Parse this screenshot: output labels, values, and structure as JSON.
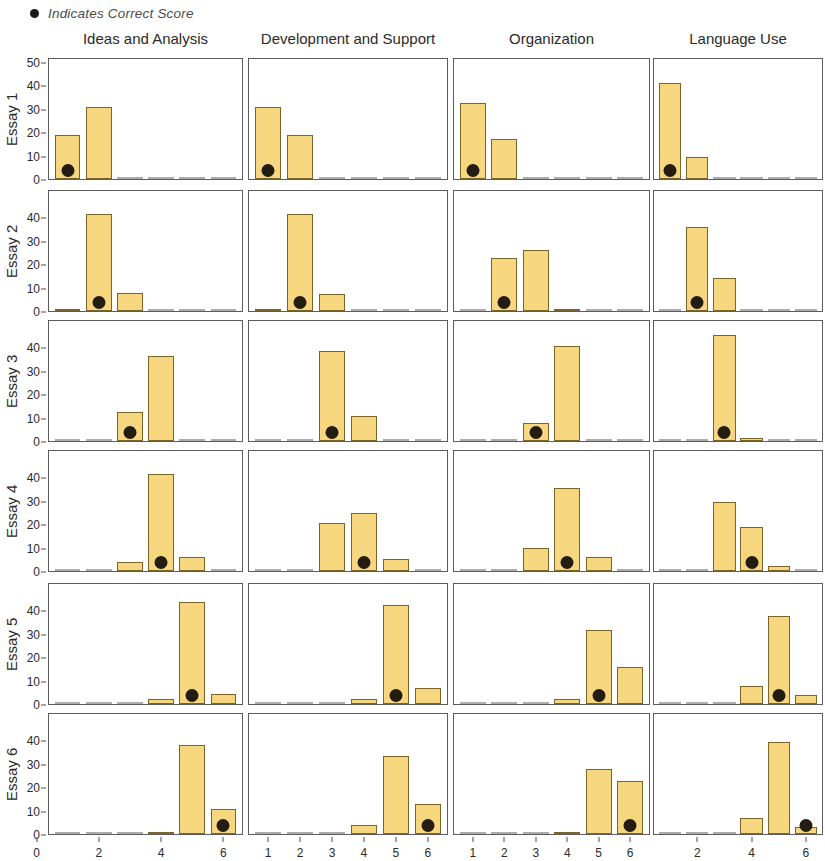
{
  "legend": {
    "marker": "filled-circle",
    "label": "Indicates Correct Score",
    "color": "#1b1b1b"
  },
  "style": {
    "bar_fill": "#f7d680",
    "bar_stroke": "#7a6427",
    "dot_color": "#231c10",
    "panel_border": "#5c5c5c"
  },
  "columns": [
    {
      "label": "Ideas and Analysis",
      "xticks": [
        0,
        2,
        4,
        6
      ]
    },
    {
      "label": "Development and Support",
      "xticks": [
        1,
        2,
        3,
        4,
        5,
        6
      ]
    },
    {
      "label": "Organization",
      "xticks": [
        1,
        2,
        3,
        4,
        5,
        6
      ]
    },
    {
      "label": "Language Use",
      "xticks": [
        2,
        4,
        6
      ]
    }
  ],
  "rows": [
    {
      "label": "Essay 1"
    },
    {
      "label": "Essay 2"
    },
    {
      "label": "Essay 3"
    },
    {
      "label": "Essay 4"
    },
    {
      "label": "Essay 5"
    },
    {
      "label": "Essay 6"
    }
  ],
  "yticks": [
    0,
    10,
    20,
    30,
    40,
    50
  ],
  "chart_data": {
    "type": "bar",
    "title": "",
    "subtitle": "",
    "xlabel": "Score",
    "ylabel": "Percent of Raters",
    "xlim": [
      0.4,
      6.6
    ],
    "ylim": [
      0,
      52
    ],
    "grid": false,
    "legend_position": "top-left",
    "legend_entries": [
      "Indicates Correct Score"
    ],
    "annotation": "Black dot marks the correct (official) score for each essay / domain.",
    "facet_rows": [
      "Essay 1",
      "Essay 2",
      "Essay 3",
      "Essay 4",
      "Essay 5",
      "Essay 6"
    ],
    "facet_cols": [
      "Ideas and Analysis",
      "Development and Support",
      "Organization",
      "Language Use"
    ],
    "categories": [
      1,
      2,
      3,
      4,
      5,
      6
    ],
    "panels": [
      {
        "row": "Essay 1",
        "col": "Ideas and Analysis",
        "values": [
          19,
          31,
          0,
          0,
          0,
          0
        ],
        "correct_score": 1
      },
      {
        "row": "Essay 1",
        "col": "Development and Support",
        "values": [
          31,
          19,
          0,
          0,
          0,
          0
        ],
        "correct_score": 1
      },
      {
        "row": "Essay 1",
        "col": "Organization",
        "values": [
          33,
          17.5,
          0,
          0,
          0,
          0
        ],
        "correct_score": 1
      },
      {
        "row": "Essay 1",
        "col": "Language Use",
        "values": [
          41.5,
          9.5,
          0,
          0,
          0,
          0
        ],
        "correct_score": 1
      },
      {
        "row": "Essay 2",
        "col": "Ideas and Analysis",
        "values": [
          0.5,
          42,
          8,
          0,
          0,
          0
        ],
        "correct_score": 2
      },
      {
        "row": "Essay 2",
        "col": "Development and Support",
        "values": [
          0.7,
          42,
          7.5,
          0,
          0,
          0
        ],
        "correct_score": 2
      },
      {
        "row": "Essay 2",
        "col": "Organization",
        "values": [
          0,
          23,
          26.5,
          0.6,
          0,
          0
        ],
        "correct_score": 2
      },
      {
        "row": "Essay 2",
        "col": "Language Use",
        "values": [
          0,
          36.5,
          14.5,
          0,
          0,
          0
        ],
        "correct_score": 2
      },
      {
        "row": "Essay 3",
        "col": "Ideas and Analysis",
        "values": [
          0,
          0,
          12.5,
          37,
          0,
          0
        ],
        "correct_score": 3
      },
      {
        "row": "Essay 3",
        "col": "Development and Support",
        "values": [
          0,
          0,
          39,
          11,
          0,
          0
        ],
        "correct_score": 3
      },
      {
        "row": "Essay 3",
        "col": "Organization",
        "values": [
          0,
          0,
          8,
          41,
          0,
          0
        ],
        "correct_score": 3
      },
      {
        "row": "Essay 3",
        "col": "Language Use",
        "values": [
          0,
          0,
          46,
          1.2,
          0,
          0
        ],
        "correct_score": 3
      },
      {
        "row": "Essay 4",
        "col": "Ideas and Analysis",
        "values": [
          0,
          0,
          4,
          42,
          6,
          0
        ],
        "correct_score": 4
      },
      {
        "row": "Essay 4",
        "col": "Development and Support",
        "values": [
          0,
          0,
          21,
          25,
          5,
          0
        ],
        "correct_score": 4
      },
      {
        "row": "Essay 4",
        "col": "Organization",
        "values": [
          0,
          0,
          10,
          36,
          6,
          0
        ],
        "correct_score": 4
      },
      {
        "row": "Essay 4",
        "col": "Language Use",
        "values": [
          0,
          0,
          30,
          19,
          2,
          0
        ],
        "correct_score": 4
      },
      {
        "row": "Essay 5",
        "col": "Ideas and Analysis",
        "values": [
          0,
          0,
          0,
          2,
          44,
          4.5
        ],
        "correct_score": 5
      },
      {
        "row": "Essay 5",
        "col": "Development and Support",
        "values": [
          0,
          0,
          0,
          2,
          43,
          7
        ],
        "correct_score": 5
      },
      {
        "row": "Essay 5",
        "col": "Organization",
        "values": [
          0,
          0,
          0,
          2,
          32,
          16
        ],
        "correct_score": 5
      },
      {
        "row": "Essay 5",
        "col": "Language Use",
        "values": [
          0,
          0,
          0,
          8,
          38,
          4
        ],
        "correct_score": 5
      },
      {
        "row": "Essay 6",
        "col": "Ideas and Analysis",
        "values": [
          0,
          0,
          0,
          1,
          38.5,
          11
        ],
        "correct_score": 6
      },
      {
        "row": "Essay 6",
        "col": "Development and Support",
        "values": [
          0,
          0,
          0,
          4,
          34,
          13
        ],
        "correct_score": 6
      },
      {
        "row": "Essay 6",
        "col": "Organization",
        "values": [
          0,
          0,
          0,
          1,
          28,
          23
        ],
        "correct_score": 6
      },
      {
        "row": "Essay 6",
        "col": "Language Use",
        "values": [
          0,
          0,
          0,
          7,
          40,
          3
        ],
        "correct_score": 6
      }
    ]
  }
}
